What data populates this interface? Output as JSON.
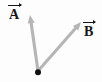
{
  "figure": {
    "kind": "vector-diagram",
    "width": 102,
    "height": 82,
    "background_color": "#fdfdfd",
    "shaft_color": "#b5b5b5",
    "label_color": "#151515",
    "origin_dot_color": "#101010"
  },
  "labels": {
    "vector_a": "A",
    "vector_b": "B"
  },
  "chart_data": {
    "type": "scatter",
    "title": "",
    "xlabel": "",
    "ylabel": "",
    "grid": false,
    "legend": "none",
    "origin": {
      "x": 38,
      "y": 72,
      "label": ""
    },
    "vectors": [
      {
        "name": "A",
        "label": "A",
        "has_overbar": true,
        "tail": {
          "x": 38,
          "y": 72
        },
        "tip": {
          "x": 30,
          "y": 15
        },
        "color": "#b5b5b5",
        "label_position": {
          "x": 9,
          "y": 4
        },
        "direction_deg": 98,
        "length_px": 57.6
      },
      {
        "name": "B",
        "label": "B",
        "has_overbar": true,
        "tail": {
          "x": 38,
          "y": 72
        },
        "tip": {
          "x": 81,
          "y": 22
        },
        "color": "#b5b5b5",
        "label_position": {
          "x": 84,
          "y": 21
        },
        "direction_deg": 49,
        "length_px": 65.9
      }
    ]
  }
}
